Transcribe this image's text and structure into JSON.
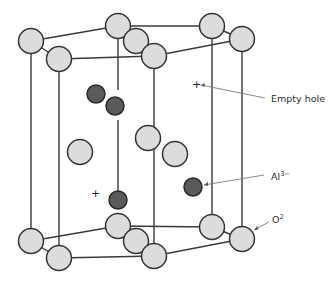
{
  "diagram": {
    "labels": {
      "empty_hole": "Empty hole",
      "aluminum": {
        "base": "Al",
        "sup": "3−"
      },
      "oxide": {
        "base": "O",
        "sup": "2"
      }
    },
    "hole_marker": "+",
    "colors": {
      "oxide_fill": "#dcdcdc",
      "aluminum_fill": "#5a5a5a",
      "edge": "#3a3a3a",
      "leader": "#7a7a7a"
    }
  }
}
